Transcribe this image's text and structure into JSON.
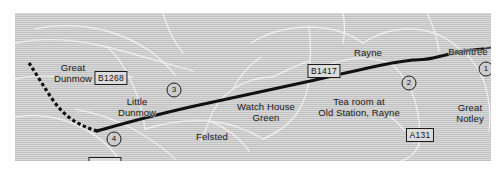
{
  "figure": {
    "kind": "route-map",
    "background_color": "#ffffff",
    "map_fill_color": "#c9c9c9",
    "route_color": "#111111",
    "minor_road_color": "#efefef"
  },
  "places": [
    {
      "id": "great-dunmow",
      "name": "Great\nDunmow",
      "x": 58,
      "y": 50
    },
    {
      "id": "little-dunmow",
      "name": "Little\nDunmow",
      "x": 122,
      "y": 84
    },
    {
      "id": "watch-house-green",
      "name": "Watch House\nGreen",
      "x": 251,
      "y": 89
    },
    {
      "id": "felsted",
      "name": "Felsted",
      "x": 197,
      "y": 119
    },
    {
      "id": "tea-room",
      "name": "Tea room at\nOld Station, Rayne",
      "x": 344,
      "y": 84
    },
    {
      "id": "rayne",
      "name": "Rayne",
      "x": 353,
      "y": 35
    },
    {
      "id": "braintree",
      "name": "Braintree",
      "x": 453,
      "y": 34
    },
    {
      "id": "great-notley",
      "name": "Great\nNotley",
      "x": 455,
      "y": 90
    }
  ],
  "road_badges": [
    {
      "id": "b1268",
      "label": "B1268",
      "x": 96,
      "y": 58
    },
    {
      "id": "b1008",
      "label": "B1008",
      "x": 90,
      "y": 144
    },
    {
      "id": "b1417",
      "label": "B1417",
      "x": 309,
      "y": 51
    },
    {
      "id": "a131",
      "label": "A131",
      "x": 405,
      "y": 115
    }
  ],
  "stop_markers": [
    {
      "id": "stop-1",
      "label": "1",
      "x": 471,
      "y": 56
    },
    {
      "id": "stop-2",
      "label": "2",
      "x": 394,
      "y": 70
    },
    {
      "id": "stop-3",
      "label": "3",
      "x": 159,
      "y": 77
    },
    {
      "id": "stop-4",
      "label": "4",
      "x": 99,
      "y": 126
    }
  ],
  "route": {
    "solid_path": "M 82 118 C 110 110, 140 102, 175 94 C 215 85, 260 76, 300 67 C 330 60, 352 55, 372 51 C 382 49, 390 48, 398 47 C 404 46.5, 410 47, 418 45 C 428 42.5, 438 40, 450 38 C 456 37, 462 36.5, 468 36",
    "dashed_path": "M 14 50 C 22 62, 30 76, 40 90 C 50 103, 62 112, 82 118",
    "tail_path": "M 468 36 L 476 34.5",
    "stroke_width": 3.2
  },
  "minor_roads": [
    "M 0 30 C 30 24, 60 26, 92 34 C 120 41, 150 50, 178 58",
    "M 20 16 C 46 10, 78 12, 104 22 C 128 31, 146 44, 160 62",
    "M 92 34 C 104 44, 112 58, 118 72 C 124 86, 128 100, 130 116",
    "M 60 96 C 80 100, 100 106, 118 116 C 134 125, 148 134, 160 146",
    "M 0 104 C 22 100, 46 104, 66 114 C 82 122, 94 132, 104 146",
    "M 130 116 C 150 110, 172 106, 194 108 C 214 110, 232 116, 248 126",
    "M 194 108 C 198 96, 206 84, 218 76 C 230 68, 244 64, 258 64",
    "M 194 108 L 186 128",
    "M 194 108 C 210 114, 224 124, 234 138",
    "M 248 126 C 262 120, 274 112, 282 100 C 290 88, 294 76, 294 62",
    "M 294 62 C 306 54, 320 48, 336 46 C 352 44, 366 46, 378 52",
    "M 236 30 C 252 20, 272 14, 294 14 C 316 14, 334 20, 348 30",
    "M 348 30 C 360 22, 376 16, 394 16 C 412 16, 428 22, 440 32",
    "M 294 14 C 296 30, 296 46, 294 62",
    "M 378 52 C 388 62, 396 74, 400 88 C 404 102, 406 116, 404 132",
    "M 404 132 C 400 140, 394 146, 386 148",
    "M 440 32 C 452 40, 462 52, 468 66",
    "M 412 0 C 418 12, 422 24, 424 38",
    "M 148 0 C 152 14, 158 28, 168 40",
    "M 328 0 C 330 10, 330 20, 328 30",
    "M 468 66 C 474 82, 476 100, 474 118",
    "M 70 70 C 86 66, 102 64, 118 64",
    "M 0 66 C 18 62, 38 62, 56 66",
    "M 258 64 C 270 58, 282 52, 294 48",
    "M 360 96 C 372 100, 382 108, 390 118",
    "M 218 76 C 224 64, 234 52, 246 44"
  ]
}
